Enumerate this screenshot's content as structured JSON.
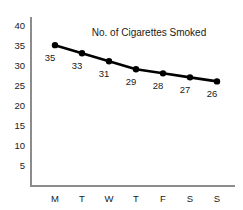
{
  "chart_data": {
    "type": "line",
    "title": "No. of Cigarettes Smoked",
    "xlabel": "",
    "ylabel": "",
    "categories": [
      "M",
      "T",
      "W",
      "T",
      "F",
      "S",
      "S"
    ],
    "values": [
      35,
      33,
      31,
      29,
      28,
      27,
      26
    ],
    "point_labels": [
      "35",
      "33",
      "31",
      "29",
      "28",
      "27",
      "26"
    ],
    "ylim": [
      0,
      42
    ],
    "yticks": [
      5,
      10,
      15,
      20,
      25,
      30,
      35,
      40
    ],
    "ytick_labels": [
      "5",
      "10",
      "15",
      "20",
      "25",
      "30",
      "35",
      "40"
    ],
    "grid": false,
    "legend": false,
    "series_color": "#000000",
    "axis_color": "#8c8c8c",
    "text_color": "#1a1a1a",
    "background_color": "#ffffff"
  }
}
